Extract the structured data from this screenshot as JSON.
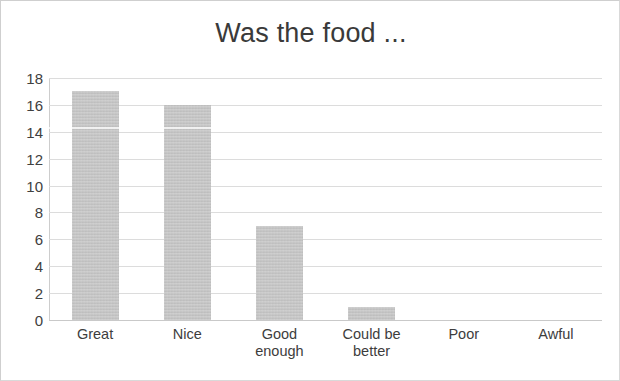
{
  "chart_data": {
    "type": "bar",
    "title": "Was the food ...",
    "xlabel": "",
    "ylabel": "",
    "categories": [
      "Great",
      "Nice",
      "Good enough",
      "Could be better",
      "Poor",
      "Awful"
    ],
    "category_lines": [
      [
        "Great"
      ],
      [
        "Nice"
      ],
      [
        "Good",
        "enough"
      ],
      [
        "Could be",
        "better"
      ],
      [
        "Poor"
      ],
      [
        "Awful"
      ]
    ],
    "values": [
      17,
      16,
      7,
      1,
      0,
      0
    ],
    "ylim": [
      0,
      18
    ],
    "y_ticks": [
      18,
      16,
      14,
      12,
      10,
      8,
      6,
      4,
      2,
      0
    ],
    "grid": true,
    "legend": "none",
    "bar_color": "#c3c3c3",
    "gridline_color": "#dcdcdc",
    "text_color": "#3a3a3a"
  }
}
